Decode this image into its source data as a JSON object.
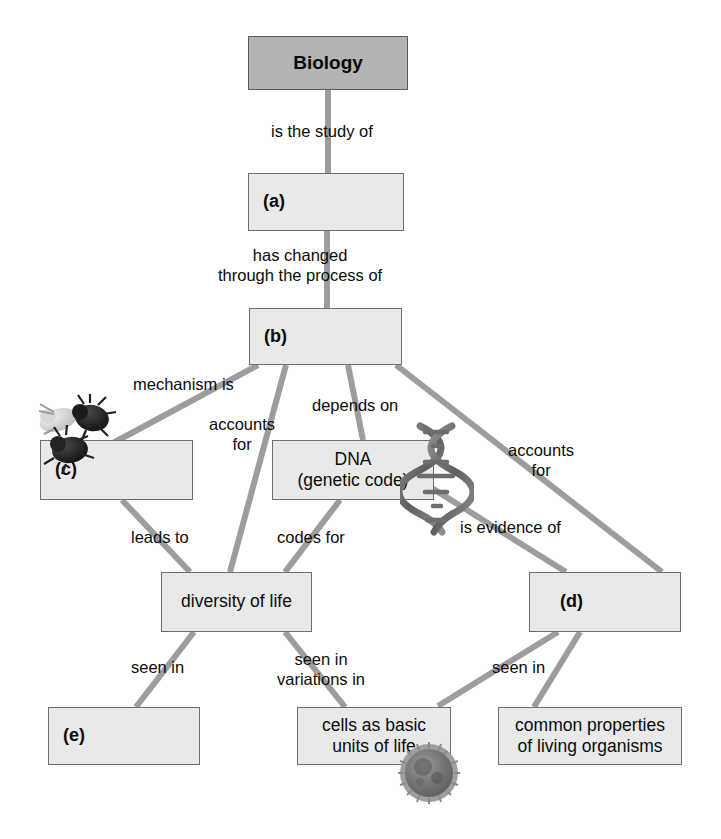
{
  "diagram": {
    "type": "concept-map",
    "title_node": "Biology",
    "background": "#ffffff",
    "node_fill": "#e9e9e9",
    "root_fill": "#b4b4b4",
    "edge_color": "#9d9d9d",
    "border_color": "#6e6e6e"
  },
  "nodes": [
    {
      "id": "biology",
      "label": "Biology",
      "x": 248,
      "y": 36,
      "w": 160,
      "h": 54,
      "style": "root"
    },
    {
      "id": "a",
      "label": "(a)",
      "x": 248,
      "y": 173,
      "w": 156,
      "h": 58,
      "style": "blank"
    },
    {
      "id": "b",
      "label": "(b)",
      "x": 249,
      "y": 308,
      "w": 153,
      "h": 57,
      "style": "blank"
    },
    {
      "id": "c",
      "label": "(c)",
      "x": 40,
      "y": 440,
      "w": 153,
      "h": 60,
      "style": "blank"
    },
    {
      "id": "dna",
      "label": "DNA\n(genetic code)",
      "x": 272,
      "y": 440,
      "w": 162,
      "h": 60,
      "style": "text"
    },
    {
      "id": "d",
      "label": "(d)",
      "x": 529,
      "y": 572,
      "w": 152,
      "h": 60,
      "style": "blank-indent"
    },
    {
      "id": "diversity",
      "label": "diversity of life",
      "x": 161,
      "y": 572,
      "w": 151,
      "h": 60,
      "style": "text"
    },
    {
      "id": "e",
      "label": "(e)",
      "x": 48,
      "y": 707,
      "w": 152,
      "h": 58,
      "style": "blank"
    },
    {
      "id": "cells",
      "label": "cells as basic\nunits of life",
      "x": 297,
      "y": 707,
      "w": 154,
      "h": 58,
      "style": "text"
    },
    {
      "id": "common",
      "label": "common properties\nof living organisms",
      "x": 498,
      "y": 707,
      "w": 184,
      "h": 58,
      "style": "text"
    }
  ],
  "edges": [
    {
      "id": "bio-a",
      "from": "biology",
      "to": "a",
      "label": "is the study of",
      "label_x": 271,
      "label_y": 122,
      "x1": 328,
      "y1": 90,
      "x2": 328,
      "y2": 173
    },
    {
      "id": "a-b",
      "from": "a",
      "to": "b",
      "label": "has changed\nthrough the process of",
      "label_x": 218,
      "label_y": 246,
      "x1": 327,
      "y1": 231,
      "x2": 327,
      "y2": 308
    },
    {
      "id": "b-c",
      "from": "b",
      "to": "c",
      "label": "mechanism is",
      "label_x": 133,
      "label_y": 375,
      "x1": 258,
      "y1": 365,
      "x2": 113,
      "y2": 443
    },
    {
      "id": "b-diversity",
      "from": "b",
      "to": "diversity",
      "label": "accounts\nfor",
      "label_x": 209,
      "label_y": 415,
      "x1": 286,
      "y1": 365,
      "x2": 230,
      "y2": 572
    },
    {
      "id": "b-dna",
      "from": "b",
      "to": "dna",
      "label": "depends on",
      "label_x": 312,
      "label_y": 396,
      "x1": 348,
      "y1": 365,
      "x2": 363,
      "y2": 440
    },
    {
      "id": "b-d",
      "from": "b",
      "to": "d",
      "label": "accounts\nfor",
      "label_x": 508,
      "label_y": 441,
      "x1": 396,
      "y1": 365,
      "x2": 662,
      "y2": 572
    },
    {
      "id": "c-diversity",
      "from": "c",
      "to": "diversity",
      "label": "leads to",
      "label_x": 131,
      "label_y": 528,
      "x1": 122,
      "y1": 500,
      "x2": 190,
      "y2": 572
    },
    {
      "id": "dna-diversity",
      "from": "dna",
      "to": "diversity",
      "label": "codes for",
      "label_x": 277,
      "label_y": 528,
      "x1": 340,
      "y1": 500,
      "x2": 285,
      "y2": 572
    },
    {
      "id": "dna-d",
      "from": "dna",
      "to": "d",
      "label": "is evidence of",
      "label_x": 460,
      "label_y": 518,
      "x1": 427,
      "y1": 485,
      "x2": 566,
      "y2": 572
    },
    {
      "id": "diversity-e",
      "from": "diversity",
      "to": "e",
      "label": "seen in",
      "label_x": 131,
      "label_y": 658,
      "x1": 194,
      "y1": 632,
      "x2": 136,
      "y2": 707
    },
    {
      "id": "diversity-cells",
      "from": "diversity",
      "to": "cells",
      "label": "seen in\nvariations in",
      "label_x": 277,
      "label_y": 650,
      "x1": 285,
      "y1": 632,
      "x2": 345,
      "y2": 707
    },
    {
      "id": "d-cells",
      "from": "d",
      "to": "cells",
      "label": "",
      "label_x": 0,
      "label_y": 0,
      "x1": 558,
      "y1": 632,
      "x2": 438,
      "y2": 706
    },
    {
      "id": "d-common",
      "from": "d",
      "to": "common",
      "label": "seen in",
      "label_x": 492,
      "label_y": 658,
      "x1": 580,
      "y1": 632,
      "x2": 534,
      "y2": 707
    }
  ],
  "images": [
    {
      "id": "fruit-flies",
      "name": "fruit-fly-illustration",
      "x": 38,
      "y": 396,
      "w": 92,
      "h": 80
    },
    {
      "id": "dna-helix",
      "name": "dna-double-helix-illustration",
      "x": 402,
      "y": 424,
      "w": 70,
      "h": 110
    },
    {
      "id": "cell",
      "name": "animal-cell-illustration",
      "x": 398,
      "y": 742,
      "w": 62,
      "h": 62
    }
  ]
}
